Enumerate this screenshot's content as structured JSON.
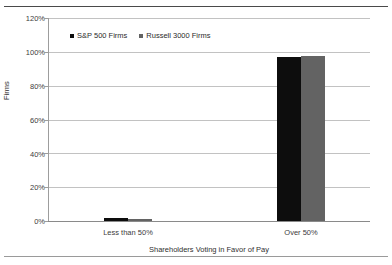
{
  "chart_data": {
    "type": "bar",
    "title": "",
    "xlabel": "Shareholders Voting in Favor of Pay",
    "ylabel": "Firms",
    "categories": [
      "Less than 50%",
      "Over 50%"
    ],
    "series": [
      {
        "name": "S&P 500 Firms",
        "color": "#0d0d0d",
        "values": [
          1.5,
          97.0
        ]
      },
      {
        "name": "Russell 3000 Firms",
        "color": "#636363",
        "values": [
          1.0,
          97.8
        ]
      }
    ],
    "ylim": [
      0,
      120
    ],
    "yticks": [
      "0%",
      "20%",
      "40%",
      "60%",
      "80%",
      "100%",
      "120%"
    ],
    "ytick_values": [
      0,
      20,
      40,
      60,
      80,
      100,
      120
    ],
    "grid": true,
    "legend_position": "top-left-inside",
    "plot_border": "left-and-bottom-axis"
  },
  "legend": {
    "entries": [
      {
        "label": "S&P 500 Firms",
        "swatch": "legend-swatch-sp500"
      },
      {
        "label": "Russell 3000 Firms",
        "swatch": "legend-swatch-russell3000"
      }
    ]
  }
}
